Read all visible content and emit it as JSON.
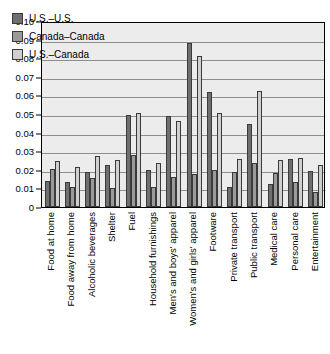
{
  "chart_data": {
    "type": "bar",
    "title": "",
    "subtitle": "",
    "xlabel": "",
    "ylabel": "",
    "ylim": [
      0,
      0.1
    ],
    "ytick_labels": [
      "0.10",
      "0.09",
      "0.08",
      "0.07",
      "0.06",
      "0.05",
      "0.04",
      "0.03",
      "0.02",
      "0.01",
      "0"
    ],
    "ytick_values": [
      0.1,
      0.09,
      0.08,
      0.07,
      0.06,
      0.05,
      0.04,
      0.03,
      0.02,
      0.01,
      0
    ],
    "grid": true,
    "legend_position": "upper-left",
    "categories": [
      "Food at home",
      "Food away from home",
      "Alcoholic beverages",
      "Shelter",
      "Fuel",
      "Household furnishings",
      "Men's and boys' apparel",
      "Women's and girls' apparel",
      "Footware",
      "Private transport",
      "Public transport",
      "Medical care",
      "Personal care",
      "Entertainment"
    ],
    "series": [
      {
        "name": "U.S.-U.S.",
        "color": "#6f6f6f",
        "values": [
          0.014,
          0.0134,
          0.0187,
          0.0224,
          0.0493,
          0.0199,
          0.0487,
          0.088,
          0.0616,
          0.0108,
          0.0445,
          0.0124,
          0.0256,
          0.0196
        ]
      },
      {
        "name": "Canada-Canada",
        "color": "#9a9a9a",
        "values": [
          0.0203,
          0.0107,
          0.0155,
          0.01,
          0.0281,
          0.0105,
          0.016,
          0.0178,
          0.0198,
          0.019,
          0.0237,
          0.0183,
          0.0133,
          0.0079
        ]
      },
      {
        "name": "U.S.-Canada",
        "color": "#cfcfcf",
        "values": [
          0.0249,
          0.0213,
          0.0274,
          0.0252,
          0.0504,
          0.0236,
          0.0461,
          0.081,
          0.0504,
          0.0258,
          0.0625,
          0.0252,
          0.0265,
          0.0224
        ]
      }
    ]
  },
  "legend": {
    "items": [
      {
        "label": "U.S.–U.S."
      },
      {
        "label": "Canada–Canada"
      },
      {
        "label": "U.S.–Canada"
      }
    ]
  }
}
